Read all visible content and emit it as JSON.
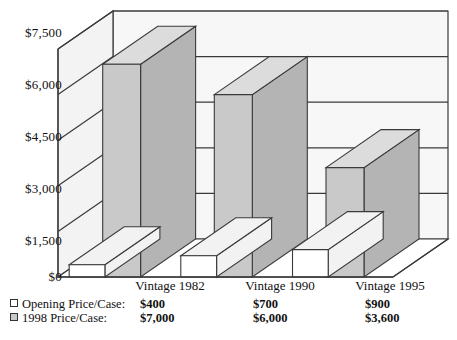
{
  "chart_data": {
    "type": "bar",
    "title": "",
    "subtitle": "",
    "xlabel": "",
    "ylabel": "",
    "categories": [
      "Vintage 1982",
      "Vintage 1990",
      "Vintage 1995"
    ],
    "series": [
      {
        "name": "Opening Price/Case:",
        "swatch": "open",
        "color": "#ffffff",
        "values": [
          400,
          700,
          900
        ],
        "value_labels": [
          "$400",
          "$700",
          "$900"
        ]
      },
      {
        "name": "1998 Price/Case:",
        "swatch": "filled",
        "color": "#c9c9c9",
        "values": [
          7000,
          6000,
          3600
        ],
        "value_labels": [
          "$7,000",
          "$6,000",
          "$3,600"
        ]
      }
    ],
    "ylim": [
      0,
      7500
    ],
    "ytick_values": [
      0,
      1500,
      3000,
      4500,
      6000,
      7500
    ],
    "ytick_labels": [
      "$0",
      "$1,500",
      "$3,000",
      "$4,500",
      "$6,000",
      "$7,500"
    ],
    "grid": true,
    "legend_position": "bottom-left",
    "projection": "3d",
    "colors": {
      "bar_fill": "#c9c9c9",
      "bar_top": "#dcdcdc",
      "bar_side": "#b4b4b4",
      "open_fill": "#ffffff",
      "open_top": "#f2f2f2",
      "wall_back": "#f7f7f7",
      "wall_side": "#f3f3f3",
      "floor": "#ffffff",
      "line": "#3a3a3a",
      "text": "#111111"
    }
  },
  "axis": {
    "tick_0": "$0",
    "tick_1": "$1,500",
    "tick_2": "$3,000",
    "tick_3": "$4,500",
    "tick_4": "$6,000",
    "tick_5": "$7,500"
  },
  "categories": {
    "c0": "Vintage 1982",
    "c1": "Vintage 1990",
    "c2": "Vintage 1995"
  },
  "legend": {
    "rows": [
      {
        "label": "Opening Price/Case:",
        "v0": "$400",
        "v1": "$700",
        "v2": "$900"
      },
      {
        "label": "1998 Price/Case:",
        "v0": "$7,000",
        "v1": "$6,000",
        "v2": "$3,600"
      }
    ]
  }
}
